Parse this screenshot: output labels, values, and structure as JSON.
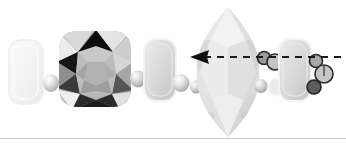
{
  "figure": {
    "type": "photographic-illustration",
    "background_color": "#ffffff",
    "width": 346,
    "height": 147
  },
  "rule": {
    "name": "bottom-divider",
    "color": "#c9c9c9",
    "y": 138,
    "thickness": 1
  },
  "annotation": {
    "type": "dashed-arrow",
    "direction": "left",
    "color": "#1a1a1a",
    "line_y": 57,
    "x_start": 341,
    "x_end": 196,
    "dash_pattern": "7 6",
    "stroke_width": 2.2,
    "arrow_tip_x": 190,
    "arrow_half_height": 7,
    "arrow_length": 18
  },
  "objects": [
    {
      "name": "pale-rounded-rect-bead-1",
      "shape": "rounded-rect",
      "cx": 26,
      "cy": 72,
      "w": 34,
      "h": 64,
      "r": 12,
      "fill": "#f4f4f4",
      "stroke": "#ededed",
      "opacity": 0.9
    },
    {
      "name": "small-round-bead-1",
      "shape": "sphere",
      "cx": 51,
      "cy": 83,
      "rx": 8,
      "ry": 9,
      "fill": "#dcdcdc",
      "highlight": "#f0f0f0"
    },
    {
      "name": "cushion-cut-dark-gem",
      "shape": "cushion-facet-gem",
      "cx": 95,
      "cy": 68,
      "w": 72,
      "h": 76,
      "fill": "#b4b4b4",
      "facet_colors": [
        "#0d0d0d",
        "#2e2e2e",
        "#565656",
        "#7d7d7d",
        "#9a9a9a",
        "#b8b8b8",
        "#d2d2d2",
        "#e6e6e6"
      ]
    },
    {
      "name": "small-round-bead-2",
      "shape": "sphere",
      "cx": 138,
      "cy": 79,
      "rx": 8,
      "ry": 8.5,
      "fill": "#cfcfcf",
      "highlight": "#ebebeb"
    },
    {
      "name": "rounded-rect-bead-2",
      "shape": "rounded-rect",
      "cx": 160,
      "cy": 70,
      "w": 32,
      "h": 62,
      "r": 12,
      "fill": "#d8d8d8",
      "stroke": "#f2f2f2",
      "opacity": 1
    },
    {
      "name": "small-round-bead-3",
      "shape": "sphere",
      "cx": 181,
      "cy": 83,
      "rx": 8.5,
      "ry": 9,
      "fill": "#cdcdcd",
      "highlight": "#e9e9e9"
    },
    {
      "name": "small-round-bead-4",
      "shape": "sphere",
      "cx": 196,
      "cy": 87,
      "rx": 6,
      "ry": 6.5,
      "fill": "#b9b9b9",
      "highlight": "#dadada"
    },
    {
      "name": "marquise-cut-pale-gem",
      "shape": "marquise-facet-gem",
      "cx": 228,
      "cy": 72,
      "w": 62,
      "h": 132,
      "fill": "#e4e4e4",
      "facet_colors": [
        "#d3d3d3",
        "#dcdcdc",
        "#e6e6e6",
        "#efefef",
        "#f6f6f6"
      ]
    },
    {
      "name": "small-round-bead-5",
      "shape": "sphere",
      "cx": 261,
      "cy": 86,
      "rx": 6.5,
      "ry": 7,
      "fill": "#c2c2c2",
      "highlight": "#dedede"
    },
    {
      "name": "outlined-circle-bead-1",
      "shape": "outlined-circle",
      "cx": 264,
      "cy": 58,
      "r": 6.5,
      "fill": "#9a9a9a",
      "stroke": "#2b2b2b"
    },
    {
      "name": "outlined-circle-bead-2",
      "shape": "outlined-circle",
      "cx": 275,
      "cy": 62,
      "r": 8,
      "fill": "#c4c4c4",
      "stroke": "#2b2b2b"
    },
    {
      "name": "small-round-bead-6",
      "shape": "sphere",
      "cx": 276,
      "cy": 87,
      "rx": 8,
      "ry": 8.5,
      "fill": "#e0e0e0",
      "highlight": "#f0f0f0"
    },
    {
      "name": "rounded-rect-bead-3",
      "shape": "rounded-rect",
      "cx": 295,
      "cy": 70,
      "w": 32,
      "h": 62,
      "r": 12,
      "fill": "#dcdcdc",
      "stroke": "#f2f2f2",
      "opacity": 1
    },
    {
      "name": "outlined-circle-bead-3",
      "shape": "outlined-circle",
      "cx": 316,
      "cy": 61,
      "r": 6.5,
      "fill": "#a9a9a9",
      "stroke": "#2b2b2b"
    },
    {
      "name": "outlined-circle-bead-4",
      "shape": "outlined-circle",
      "cx": 324,
      "cy": 74,
      "r": 9,
      "fill": "#c6c6c6",
      "stroke": "#2b2b2b",
      "inner_line": true
    },
    {
      "name": "outlined-circle-bead-5",
      "shape": "outlined-circle",
      "cx": 314,
      "cy": 87,
      "r": 7,
      "fill": "#5c5c5c",
      "stroke": "#222222"
    }
  ]
}
